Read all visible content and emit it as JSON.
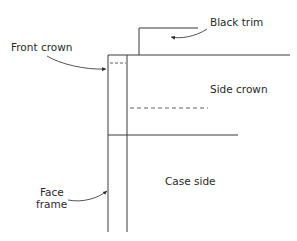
{
  "diagram": {
    "labels": {
      "black_trim": "Black trim",
      "front_crown": "Front crown",
      "side_crown": "Side crown",
      "case_side": "Case side",
      "face_frame_line1": "Face",
      "face_frame_line2": "frame"
    },
    "colors": {
      "line": "#3a3a3a",
      "text": "#2a2a2a",
      "background": "#ffffff"
    }
  }
}
